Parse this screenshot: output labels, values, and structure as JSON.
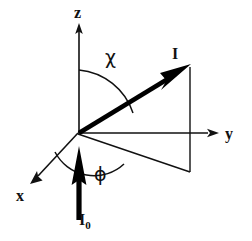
{
  "figure": {
    "kind": "vector-geometry-diagram",
    "background_color": "#ffffff",
    "stroke_color": "#111111",
    "bold_stroke_color": "#000000"
  },
  "axes": {
    "z": {
      "label": "z",
      "label_x": 74,
      "label_y": 5,
      "from": [
        79,
        133
      ],
      "to": [
        79,
        25
      ],
      "arrow": true
    },
    "y": {
      "label": "y",
      "label_x": 225,
      "label_y": 126,
      "from": [
        78,
        133
      ],
      "to": [
        216,
        133
      ],
      "arrow": true
    },
    "x": {
      "label": "x",
      "label_x": 16,
      "label_y": 188,
      "from": [
        78,
        133
      ],
      "to": [
        32,
        182
      ],
      "arrow": true
    },
    "origin": [
      78,
      133
    ]
  },
  "vectors": {
    "I": {
      "label": "I",
      "label_x": 172,
      "label_y": 46,
      "from": [
        78,
        133
      ],
      "to": [
        189,
        66
      ],
      "style": "thick-filled-arrow"
    },
    "I0": {
      "label": "I",
      "subscript": "0",
      "label_x": 79,
      "label_y": 212,
      "from": [
        79,
        219
      ],
      "to": [
        79,
        147
      ],
      "style": "thick-filled-arrow"
    }
  },
  "angles": {
    "chi": {
      "symbol": "χ",
      "label_x": 105,
      "label_y": 48,
      "between": [
        "z-axis",
        "I-vector"
      ],
      "arc_start": [
        79,
        70
      ],
      "arc_end": [
        131,
        110
      ]
    },
    "phi": {
      "symbol": "ϕ",
      "label_x": 94,
      "label_y": 165,
      "between": [
        "x-axis",
        "I-projection"
      ],
      "arc_start": [
        55,
        152
      ],
      "arc_end": [
        122,
        163
      ]
    }
  },
  "projection": {
    "description": "Projection of I onto the y-x plane: drop line from the I arrow tip and the in-plane ray from the origin.",
    "drop_line": {
      "from": [
        190,
        66
      ],
      "to": [
        190,
        172
      ]
    },
    "plane_ray": {
      "from": [
        78,
        134
      ],
      "to": [
        190,
        172
      ]
    }
  }
}
